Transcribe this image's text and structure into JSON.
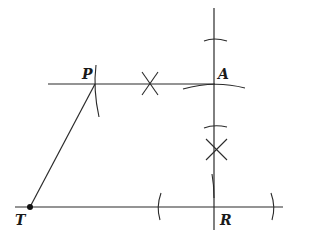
{
  "diagram": {
    "type": "geometric-construction",
    "colors": {
      "stroke": "#2a2a2a",
      "background": "#ffffff"
    },
    "points": [
      {
        "id": "P",
        "label": "P",
        "x": 95,
        "y": 84
      },
      {
        "id": "A",
        "label": "A",
        "x": 214,
        "y": 84
      },
      {
        "id": "T",
        "label": "T",
        "x": 30,
        "y": 207
      },
      {
        "id": "R",
        "label": "R",
        "x": 214,
        "y": 207
      }
    ],
    "segments": [
      {
        "name": "line-through-P-A",
        "from": [
          48,
          84
        ],
        "to": [
          215,
          84
        ]
      },
      {
        "name": "perpendicular-through-A-R",
        "from": [
          214,
          8
        ],
        "to": [
          214,
          230
        ]
      },
      {
        "name": "line-through-T-R",
        "from": [
          15,
          207
        ],
        "to": [
          283,
          207
        ]
      },
      {
        "name": "segment-T-P",
        "from": [
          30,
          207
        ],
        "to": [
          95,
          84
        ]
      }
    ],
    "bisector_marks": [
      {
        "name": "x-mark-on-PA",
        "x": 149,
        "y": 84
      },
      {
        "name": "x-mark-on-AR",
        "x": 215,
        "y": 149
      }
    ],
    "labels": {
      "P": "P",
      "A": "A",
      "T": "T",
      "R": "R"
    }
  }
}
